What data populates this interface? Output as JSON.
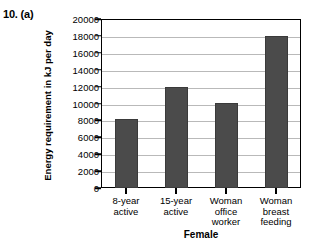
{
  "question_label": "10. (a)",
  "page_header": {
    "left_cutoff": "",
    "right_cutoff": ""
  },
  "chart_data": {
    "type": "bar",
    "title": "",
    "xlabel": "Female",
    "ylabel": "Energy requirement in kJ per day",
    "categories": [
      "8-year active",
      "15-year active",
      "Woman office worker",
      "Woman breast feeding"
    ],
    "category_lines": [
      [
        "8-year",
        "active"
      ],
      [
        "15-year",
        "active"
      ],
      [
        "Woman",
        "office",
        "worker"
      ],
      [
        "Woman",
        "breast",
        "feeding"
      ]
    ],
    "values": [
      8200,
      12000,
      10100,
      18000
    ],
    "ylim": [
      0,
      20000
    ],
    "ytick_step": 2000,
    "yticks": [
      0,
      2000,
      4000,
      6000,
      8000,
      10000,
      12000,
      14000,
      16000,
      18000,
      20000
    ],
    "ytick_labels": [
      "0",
      "2000",
      "4000",
      "6000",
      "8000",
      "10000",
      "12000",
      "14000",
      "16000",
      "18000",
      "20000"
    ],
    "grid": true,
    "legend": false,
    "bar_color": "#4b4b4b",
    "grid_color": "#b9b9b9",
    "axis_color": "#000000"
  }
}
